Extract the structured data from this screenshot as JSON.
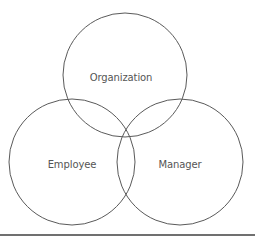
{
  "diagram": {
    "type": "venn",
    "sets": [
      {
        "id": "organization",
        "label": "Organization",
        "cx": 125,
        "cy": 75,
        "r": 62
      },
      {
        "id": "employee",
        "label": "Employee",
        "cx": 72,
        "cy": 162,
        "r": 63
      },
      {
        "id": "manager",
        "label": "Manager",
        "cx": 180,
        "cy": 162,
        "r": 63
      }
    ],
    "stroke_color": "#5a5a5a",
    "label_color": "#555555",
    "rule_color": "#707070"
  }
}
